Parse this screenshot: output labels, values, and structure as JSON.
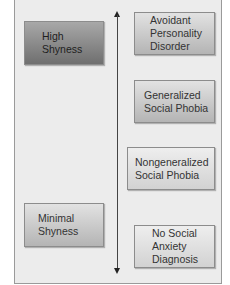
{
  "left_column": {
    "high": "High\nShyness",
    "minimal": "Minimal\nShyness"
  },
  "right_column": {
    "items": [
      "Avoidant\nPersonality\nDisorder",
      "Generalized\nSocial Phobia",
      "Nongeneralized\nSocial Phobia",
      "No Social\nAnxiety\nDiagnosis"
    ]
  },
  "axis": {
    "direction": "bidirectional-vertical"
  }
}
